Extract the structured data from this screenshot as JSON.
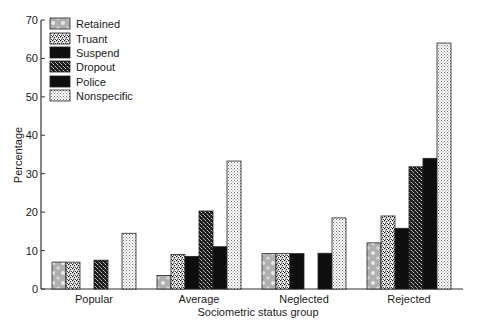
{
  "chart_data": {
    "type": "bar",
    "title": "",
    "xlabel": "Sociometric status group",
    "ylabel": "Percentage",
    "ylim": [
      0,
      70
    ],
    "yticks": [
      0,
      10,
      20,
      30,
      40,
      50,
      60,
      70
    ],
    "grid": false,
    "legend_position": "top-left",
    "categories": [
      "Popular",
      "Average",
      "Neglected",
      "Rejected"
    ],
    "series": [
      {
        "name": "Retained",
        "pattern": "gray-dots",
        "values": [
          7.0,
          3.5,
          9.2,
          12.0
        ]
      },
      {
        "name": "Truant",
        "pattern": "speckle-light",
        "values": [
          7.0,
          9.0,
          9.2,
          19.0
        ]
      },
      {
        "name": "Suspend",
        "pattern": "solid-black",
        "values": [
          0,
          8.5,
          9.2,
          15.8
        ]
      },
      {
        "name": "Dropout",
        "pattern": "speckle-dark",
        "values": [
          7.5,
          20.3,
          0,
          31.8
        ]
      },
      {
        "name": "Police",
        "pattern": "solid-black",
        "values": [
          0,
          11.0,
          9.3,
          34.0
        ]
      },
      {
        "name": "Nonspecific",
        "pattern": "fine-dots",
        "values": [
          14.5,
          33.3,
          18.5,
          64.0
        ]
      }
    ]
  },
  "colors": {
    "axis": "#333333",
    "bar_border": "#222222",
    "solid": "#111111",
    "retained_base": "#b5b5b5"
  }
}
